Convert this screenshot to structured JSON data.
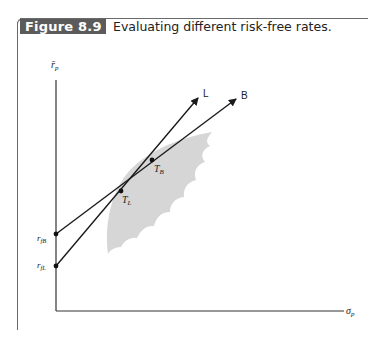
{
  "figure": {
    "number_label": "Figure 8.9",
    "caption": "Evaluating different risk-free rates."
  },
  "diagram": {
    "y_axis_label": "r̄",
    "y_axis_label_sub": "p",
    "x_axis_label": "σ",
    "x_axis_label_sub": "p",
    "lines": [
      {
        "name": "L",
        "label": "L",
        "intercept_label": "r",
        "intercept_sub": "fL",
        "tangent_label": "T",
        "tangent_sub": "L"
      },
      {
        "name": "B",
        "label": "B",
        "intercept_label": "r",
        "intercept_sub": "fB",
        "tangent_label": "T",
        "tangent_sub": "B"
      }
    ],
    "region": "feasible set of portfolios (shaded)",
    "colors": {
      "badge_bg": "#5b5b5b",
      "region_fill": "#d6d6d6",
      "line": "#1a1a1a"
    }
  }
}
